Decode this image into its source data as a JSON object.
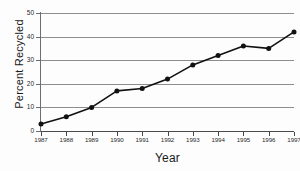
{
  "chart_data": {
    "type": "line",
    "title": "",
    "xlabel": "Year",
    "ylabel": "Percent Recycled",
    "categories": [
      1987,
      1988,
      1989,
      1990,
      1991,
      1992,
      1993,
      1994,
      1995,
      1996,
      1997
    ],
    "x_tick_labels": [
      "1987",
      "1988",
      "1989",
      "1990",
      "1991",
      "1992",
      "1993",
      "1994",
      "1995",
      "1996",
      "1997"
    ],
    "values": [
      3,
      6,
      10,
      17,
      18,
      22,
      28,
      32,
      36,
      35,
      42
    ],
    "y_tick_labels": [
      "0",
      "10",
      "20",
      "30",
      "40",
      "50"
    ],
    "y_ticks": [
      0,
      10,
      20,
      30,
      40,
      50
    ],
    "ylim": [
      0,
      50
    ],
    "xlim": [
      1987,
      1997
    ],
    "grid": true,
    "legend": false,
    "series": [
      {
        "name": "Percent Recycled",
        "values": [
          3,
          6,
          10,
          17,
          18,
          22,
          28,
          32,
          36,
          35,
          42
        ],
        "marker": "circle",
        "line_color": "#111111",
        "marker_color": "#111111"
      }
    ],
    "colors": {
      "background": "#fdfdfd",
      "gridline": "#8d8d8d",
      "axis": "#4a4a4a",
      "text": "#1a1a1a",
      "line": "#111111"
    }
  }
}
